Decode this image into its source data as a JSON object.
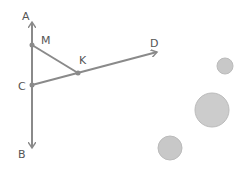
{
  "diagram": {
    "stroke_color": "#8a8a8a",
    "circle_color": "#c8c8c8",
    "points": [
      {
        "id": "A",
        "label": "A",
        "x": 32,
        "y": 22,
        "lx": 22,
        "ly": 20
      },
      {
        "id": "M",
        "label": "M",
        "x": 32,
        "y": 45,
        "lx": 41,
        "ly": 44
      },
      {
        "id": "C",
        "label": "C",
        "x": 32,
        "y": 85,
        "lx": 18,
        "ly": 90
      },
      {
        "id": "B",
        "label": "B",
        "x": 32,
        "y": 148,
        "lx": 18,
        "ly": 158
      },
      {
        "id": "K",
        "label": "K",
        "x": 78,
        "y": 73,
        "lx": 79,
        "ly": 64
      },
      {
        "id": "D",
        "label": "D",
        "x": 157,
        "y": 52,
        "lx": 150,
        "ly": 47
      }
    ],
    "circles": [
      {
        "cx": 225,
        "cy": 66,
        "r": 8
      },
      {
        "cx": 212,
        "cy": 110,
        "r": 17
      },
      {
        "cx": 170,
        "cy": 148,
        "r": 12
      }
    ]
  }
}
